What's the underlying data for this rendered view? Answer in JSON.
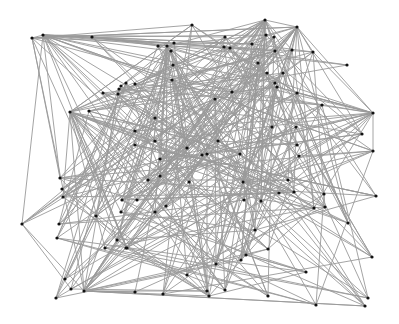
{
  "diagram": {
    "type": "network-graph",
    "edge_color": "#9a9a9a",
    "node_color": "#111111",
    "background": "#ffffff",
    "nodes": [
      [
        32,
        38
      ],
      [
        43,
        35
      ],
      [
        92,
        37
      ],
      [
        70,
        112
      ],
      [
        89,
        111
      ],
      [
        103,
        93
      ],
      [
        119,
        89
      ],
      [
        121,
        86
      ],
      [
        126,
        83
      ],
      [
        118,
        94
      ],
      [
        135,
        84
      ],
      [
        167,
        46
      ],
      [
        158,
        46
      ],
      [
        174,
        43
      ],
      [
        171,
        51
      ],
      [
        173,
        65
      ],
      [
        172,
        80
      ],
      [
        155,
        118
      ],
      [
        135,
        131
      ],
      [
        135,
        145
      ],
      [
        155,
        141
      ],
      [
        160,
        159
      ],
      [
        192,
        25
      ],
      [
        225,
        37
      ],
      [
        265,
        20
      ],
      [
        224,
        47
      ],
      [
        230,
        48
      ],
      [
        266,
        35
      ],
      [
        274,
        37
      ],
      [
        297,
        27
      ],
      [
        252,
        44
      ],
      [
        258,
        63
      ],
      [
        275,
        51
      ],
      [
        292,
        50
      ],
      [
        313,
        52
      ],
      [
        347,
        65
      ],
      [
        267,
        73
      ],
      [
        283,
        73
      ],
      [
        275,
        83
      ],
      [
        277,
        87
      ],
      [
        297,
        93
      ],
      [
        322,
        105
      ],
      [
        373,
        113
      ],
      [
        362,
        134
      ],
      [
        373,
        151
      ],
      [
        232,
        92
      ],
      [
        215,
        99
      ],
      [
        296,
        127
      ],
      [
        272,
        127
      ],
      [
        218,
        141
      ],
      [
        207,
        154
      ],
      [
        240,
        154
      ],
      [
        243,
        182
      ],
      [
        297,
        145
      ],
      [
        299,
        156
      ],
      [
        187,
        148
      ],
      [
        202,
        155
      ],
      [
        189,
        182
      ],
      [
        160,
        176
      ],
      [
        148,
        180
      ],
      [
        60,
        178
      ],
      [
        62,
        189
      ],
      [
        63,
        197
      ],
      [
        22,
        224
      ],
      [
        59,
        224
      ],
      [
        57,
        238
      ],
      [
        96,
        216
      ],
      [
        121,
        212
      ],
      [
        155,
        212
      ],
      [
        166,
        206
      ],
      [
        137,
        200
      ],
      [
        122,
        200
      ],
      [
        127,
        248
      ],
      [
        126,
        248
      ],
      [
        117,
        240
      ],
      [
        105,
        248
      ],
      [
        71,
        289
      ],
      [
        65,
        279
      ],
      [
        56,
        298
      ],
      [
        84,
        291
      ],
      [
        135,
        292
      ],
      [
        163,
        294
      ],
      [
        207,
        291
      ],
      [
        255,
        230
      ],
      [
        216,
        264
      ],
      [
        225,
        290
      ],
      [
        187,
        275
      ],
      [
        209,
        296
      ],
      [
        241,
        260
      ],
      [
        246,
        255
      ],
      [
        268,
        249
      ],
      [
        244,
        200
      ],
      [
        261,
        201
      ],
      [
        279,
        193
      ],
      [
        294,
        192
      ],
      [
        324,
        194
      ],
      [
        325,
        207
      ],
      [
        288,
        180
      ],
      [
        314,
        208
      ],
      [
        376,
        196
      ],
      [
        306,
        272
      ],
      [
        268,
        296
      ],
      [
        316,
        305
      ],
      [
        368,
        298
      ],
      [
        365,
        306
      ],
      [
        372,
        257
      ],
      [
        348,
        223
      ]
    ]
  },
  "chart_data": {
    "type": "network",
    "title": "",
    "node_count": 107
  }
}
